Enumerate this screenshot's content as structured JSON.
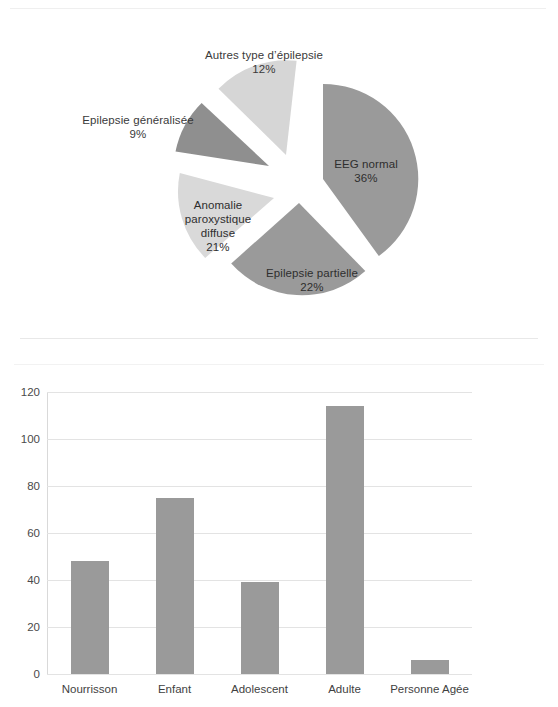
{
  "chart_data": [
    {
      "type": "pie",
      "title": "",
      "exploded": true,
      "labels": [
        "EEG normal",
        "Epilepsie partielle",
        "Anomalie paroxystique diffuse",
        "Epilepsie généralisée",
        "Autres type d’épilepsie"
      ],
      "values": [
        36,
        22,
        21,
        9,
        12
      ],
      "value_labels": [
        "36%",
        "22%",
        "21%",
        "9%",
        "12%"
      ],
      "colors": [
        "#9a9a9a",
        "#9a9a9a",
        "#d9d9d9",
        "#8f8f8f",
        "#d6d6d6"
      ],
      "label_placement": [
        "inside",
        "inside",
        "inside",
        "outside",
        "outside"
      ],
      "legend": "none"
    },
    {
      "type": "bar",
      "title": "",
      "categories": [
        "Nourrisson",
        "Enfant",
        "Adolescent",
        "Adulte",
        "Personne Agée"
      ],
      "series": [
        {
          "name": "Série1",
          "values": [
            48,
            75,
            39,
            114,
            6
          ]
        }
      ],
      "ylabel": "",
      "xlabel": "",
      "ylim": [
        0,
        120
      ],
      "yticks": [
        "0",
        "20",
        "40",
        "60",
        "80",
        "100",
        "120"
      ],
      "ytick_values": [
        0,
        20,
        40,
        60,
        80,
        100,
        120
      ],
      "grid": true,
      "legend_position": "right",
      "bar_color": "#9a9a9a"
    }
  ],
  "pie": {
    "slices": [
      {
        "label": "EEG normal",
        "pct": "36%"
      },
      {
        "label": "Epilepsie partielle",
        "pct": "22%"
      },
      {
        "label": "Anomalie paroxystique",
        "label2": "diffuse",
        "pct": "21%"
      },
      {
        "label": "Epilepsie généralisée",
        "pct": "9%"
      },
      {
        "label": "Autres type d’épilepsie",
        "pct": "12%"
      }
    ],
    "anomalie_line1": "Anomalie",
    "anomalie_line2": "paroxystique",
    "anomalie_line3": "diffuse",
    "anomalie_pct": "21%"
  },
  "bar": {
    "legend_label": "Série1"
  }
}
